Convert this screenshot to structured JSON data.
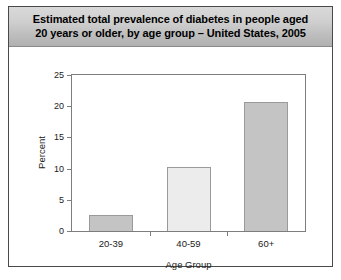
{
  "figure": {
    "title_line1": "Estimated total prevalence of diabetes in people aged",
    "title_line2": "20 years or older, by age group – United States, 2005",
    "caption": "",
    "frame_color": "#4a4a4a",
    "title_band_color": "#cfcfcf"
  },
  "chart_data": {
    "type": "bar",
    "title": "Estimated total prevalence of diabetes in people aged 20 years or older, by age group – United States, 2005",
    "categories": [
      "20-39",
      "40-59",
      "60+"
    ],
    "values": [
      2.6,
      10.3,
      20.6
    ],
    "series": [
      {
        "name": "Total prevalence of diabetes",
        "values": [
          2.6,
          10.3,
          20.6
        ]
      }
    ],
    "xlabel": "Age Group",
    "ylabel": "Percent",
    "ylim": [
      0,
      25
    ],
    "yticks": [
      0,
      5,
      10,
      15,
      20,
      25
    ],
    "ytick_labels": [
      "0",
      "5",
      "10",
      "15",
      "20",
      "25"
    ],
    "grid": false,
    "legend": false,
    "bar_colors": [
      "#c4c4c4",
      "#ececec",
      "#c4c4c4"
    ],
    "bar_edge_color": "#9a9a9a"
  }
}
